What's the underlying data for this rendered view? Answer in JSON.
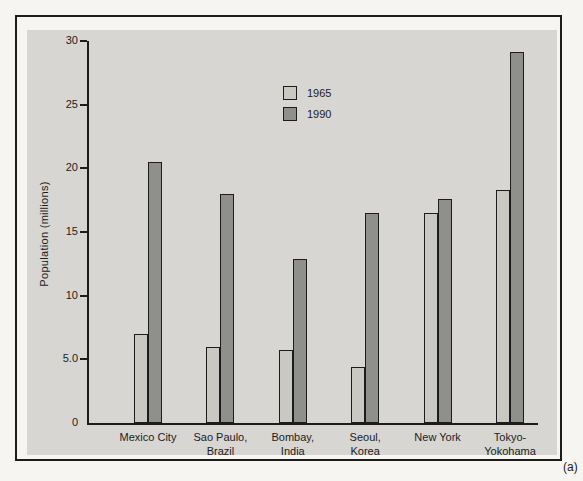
{
  "figure_label": "(a)",
  "colors": {
    "page_bg": "#f6f5f1",
    "panel_bg": "#d7d6d2",
    "frame_border": "#1c1c1c",
    "bar_outline": "#1c1c1c",
    "series_1965": "#c9c8c3",
    "series_1990": "#8f8f8c"
  },
  "chart_data": {
    "type": "bar",
    "title": "",
    "xlabel": "",
    "ylabel": "Population (millions)",
    "ylim": [
      0,
      30
    ],
    "yticks": [
      "30",
      "25",
      "20",
      "15",
      "10",
      "5.0",
      "0"
    ],
    "ytick_values": [
      30,
      25,
      20,
      15,
      10,
      5,
      0
    ],
    "grid": false,
    "legend_position": "top-center",
    "categories": [
      "Mexico City",
      "Sao Paulo,\nBrazil",
      "Bombay,\nIndia",
      "Seoul,\nKorea",
      "New York",
      "Tokyo-\nYokohama"
    ],
    "series": [
      {
        "name": "1965",
        "color": "#c9c8c3",
        "values": [
          7.0,
          6.0,
          5.7,
          4.4,
          16.5,
          18.3
        ]
      },
      {
        "name": "1990",
        "color": "#8f8f8c",
        "values": [
          20.5,
          18.0,
          12.9,
          16.5,
          17.6,
          29.1
        ]
      }
    ]
  }
}
